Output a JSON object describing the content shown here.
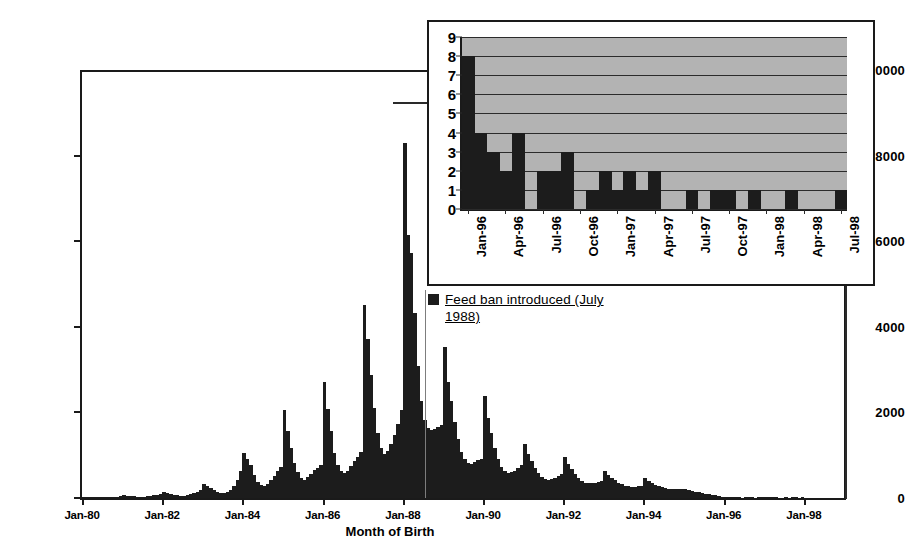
{
  "chart_data": [
    {
      "id": "main",
      "type": "bar",
      "title": "",
      "xlabel": "Month of Birth",
      "ylabel": "",
      "ylim": [
        0,
        10000
      ],
      "y_ticks": [
        0,
        2000,
        4000,
        6000,
        8000,
        10000
      ],
      "y_tick_labels": [
        "0",
        "2000",
        "4000",
        "6000",
        "8000",
        "10000"
      ],
      "x_tick_labels": [
        "Jan-80",
        "Jan-82",
        "Jan-84",
        "Jan-86",
        "Jan-88",
        "Jan-90",
        "Jan-92",
        "Jan-94",
        "Jan-96",
        "Jan-98"
      ],
      "x_start": "Jan-80",
      "x_end": "Dec-98",
      "grid": false,
      "bar_color": "#1c1c1c",
      "annotation": {
        "label": "Feed ban introduced (July 1988)",
        "x": "Jul-88",
        "line_color": "#7d7d7d"
      },
      "legend": {
        "position": "inside-right",
        "entries": [
          {
            "label": "Feed ban introduced (July 1988)",
            "color": "#1c1c1c"
          }
        ]
      },
      "categories": [
        "Jan-80",
        "Feb-80",
        "Mar-80",
        "Apr-80",
        "May-80",
        "Jun-80",
        "Jul-80",
        "Aug-80",
        "Sep-80",
        "Oct-80",
        "Nov-80",
        "Dec-80",
        "Jan-81",
        "Feb-81",
        "Mar-81",
        "Apr-81",
        "May-81",
        "Jun-81",
        "Jul-81",
        "Aug-81",
        "Sep-81",
        "Oct-81",
        "Nov-81",
        "Dec-81",
        "Jan-82",
        "Feb-82",
        "Mar-82",
        "Apr-82",
        "May-82",
        "Jun-82",
        "Jul-82",
        "Aug-82",
        "Sep-82",
        "Oct-82",
        "Nov-82",
        "Dec-82",
        "Jan-83",
        "Feb-83",
        "Mar-83",
        "Apr-83",
        "May-83",
        "Jun-83",
        "Jul-83",
        "Aug-83",
        "Sep-83",
        "Oct-83",
        "Nov-83",
        "Dec-83",
        "Jan-84",
        "Feb-84",
        "Mar-84",
        "Apr-84",
        "May-84",
        "Jun-84",
        "Jul-84",
        "Aug-84",
        "Sep-84",
        "Oct-84",
        "Nov-84",
        "Dec-84",
        "Jan-85",
        "Feb-85",
        "Mar-85",
        "Apr-85",
        "May-85",
        "Jun-85",
        "Jul-85",
        "Aug-85",
        "Sep-85",
        "Oct-85",
        "Nov-85",
        "Dec-85",
        "Jan-86",
        "Feb-86",
        "Mar-86",
        "Apr-86",
        "May-86",
        "Jun-86",
        "Jul-86",
        "Aug-86",
        "Sep-86",
        "Oct-86",
        "Nov-86",
        "Dec-86",
        "Jan-87",
        "Feb-87",
        "Mar-87",
        "Apr-87",
        "May-87",
        "Jun-87",
        "Jul-87",
        "Aug-87",
        "Sep-87",
        "Oct-87",
        "Nov-87",
        "Dec-87",
        "Jan-88",
        "Feb-88",
        "Mar-88",
        "Apr-88",
        "May-88",
        "Jun-88",
        "Jul-88",
        "Aug-88",
        "Sep-88",
        "Oct-88",
        "Nov-88",
        "Dec-88",
        "Jan-89",
        "Feb-89",
        "Mar-89",
        "Apr-89",
        "May-89",
        "Jun-89",
        "Jul-89",
        "Aug-89",
        "Sep-89",
        "Oct-89",
        "Nov-89",
        "Dec-89",
        "Jan-90",
        "Feb-90",
        "Mar-90",
        "Apr-90",
        "May-90",
        "Jun-90",
        "Jul-90",
        "Aug-90",
        "Sep-90",
        "Oct-90",
        "Nov-90",
        "Dec-90",
        "Jan-91",
        "Feb-91",
        "Mar-91",
        "Apr-91",
        "May-91",
        "Jun-91",
        "Jul-91",
        "Aug-91",
        "Sep-91",
        "Oct-91",
        "Nov-91",
        "Dec-91",
        "Jan-92",
        "Feb-92",
        "Mar-92",
        "Apr-92",
        "May-92",
        "Jun-92",
        "Jul-92",
        "Aug-92",
        "Sep-92",
        "Oct-92",
        "Nov-92",
        "Dec-92",
        "Jan-93",
        "Feb-93",
        "Mar-93",
        "Apr-93",
        "May-93",
        "Jun-93",
        "Jul-93",
        "Aug-93",
        "Sep-93",
        "Oct-93",
        "Nov-93",
        "Dec-93",
        "Jan-94",
        "Feb-94",
        "Mar-94",
        "Apr-94",
        "May-94",
        "Jun-94",
        "Jul-94",
        "Aug-94",
        "Sep-94",
        "Oct-94",
        "Nov-94",
        "Dec-94",
        "Jan-95",
        "Feb-95",
        "Mar-95",
        "Apr-95",
        "May-95",
        "Jun-95",
        "Jul-95",
        "Aug-95",
        "Sep-95",
        "Oct-95",
        "Nov-95",
        "Dec-95",
        "Jan-96",
        "Feb-96",
        "Mar-96",
        "Apr-96",
        "May-96",
        "Jun-96",
        "Jul-96",
        "Aug-96",
        "Sep-96",
        "Oct-96",
        "Nov-96",
        "Dec-96",
        "Jan-97",
        "Feb-97",
        "Mar-97",
        "Apr-97",
        "May-97",
        "Jun-97",
        "Jul-97",
        "Aug-97",
        "Sep-97",
        "Oct-97",
        "Nov-97",
        "Dec-97",
        "Jan-98",
        "Feb-98",
        "Mar-98",
        "Apr-98",
        "May-98",
        "Jun-98",
        "Jul-98",
        "Aug-98",
        "Sep-98",
        "Oct-98",
        "Nov-98",
        "Dec-98"
      ],
      "values": [
        30,
        25,
        20,
        20,
        15,
        15,
        15,
        20,
        25,
        30,
        35,
        40,
        60,
        50,
        45,
        40,
        30,
        30,
        30,
        40,
        50,
        60,
        70,
        90,
        150,
        120,
        100,
        80,
        60,
        55,
        55,
        70,
        90,
        120,
        150,
        190,
        330,
        280,
        230,
        180,
        130,
        110,
        110,
        140,
        190,
        280,
        420,
        620,
        1050,
        900,
        760,
        540,
        380,
        300,
        280,
        330,
        420,
        520,
        620,
        720,
        2060,
        1560,
        1160,
        820,
        600,
        470,
        430,
        480,
        560,
        660,
        700,
        760,
        2720,
        2080,
        1560,
        1060,
        780,
        620,
        580,
        640,
        740,
        860,
        960,
        1080,
        4500,
        3720,
        2880,
        2100,
        1520,
        1180,
        1020,
        1100,
        1260,
        1480,
        1740,
        2060,
        8300,
        6150,
        5720,
        4320,
        3080,
        2260,
        1820,
        1640,
        1580,
        1620,
        1660,
        1700,
        3520,
        2720,
        2260,
        1780,
        1380,
        1080,
        900,
        820,
        800,
        840,
        880,
        920,
        2380,
        1880,
        1520,
        1180,
        900,
        720,
        620,
        580,
        600,
        640,
        700,
        760,
        1260,
        1020,
        860,
        700,
        580,
        500,
        450,
        430,
        440,
        470,
        520,
        560,
        960,
        800,
        680,
        560,
        470,
        400,
        360,
        340,
        340,
        350,
        370,
        390,
        620,
        540,
        470,
        410,
        360,
        320,
        290,
        270,
        260,
        260,
        270,
        280,
        460,
        400,
        350,
        310,
        280,
        250,
        230,
        215,
        205,
        200,
        200,
        200,
        210,
        185,
        165,
        150,
        135,
        120,
        105,
        95,
        80,
        65,
        50,
        35,
        8,
        4,
        3,
        2,
        4,
        0,
        2,
        2,
        3,
        0,
        1,
        2,
        1,
        2,
        1,
        2,
        0,
        0,
        1,
        0,
        1,
        1,
        0,
        1,
        0,
        0,
        0,
        0,
        0,
        0,
        0,
        0,
        0,
        0,
        0,
        0
      ]
    },
    {
      "id": "inset",
      "type": "bar",
      "title": "",
      "xlabel": "",
      "ylabel": "",
      "ylim": [
        0,
        9
      ],
      "y_ticks": [
        0,
        1,
        2,
        3,
        4,
        5,
        6,
        7,
        8,
        9
      ],
      "y_tick_labels": [
        "0",
        "1",
        "2",
        "3",
        "4",
        "5",
        "6",
        "7",
        "8",
        "9"
      ],
      "grid": true,
      "plot_bg": "#b3b3b3",
      "bar_color": "#1c1c1c",
      "x_tick_labels": [
        "Jan-96",
        "Apr-96",
        "Jul-96",
        "Oct-96",
        "Jan-97",
        "Apr-97",
        "Jul-97",
        "Oct-97",
        "Jan-98",
        "Apr-98",
        "Jul-98"
      ],
      "categories": [
        "Jan-96",
        "Feb-96",
        "Mar-96",
        "Apr-96",
        "May-96",
        "Jun-96",
        "Jul-96",
        "Aug-96",
        "Sep-96",
        "Oct-96",
        "Nov-96",
        "Dec-96",
        "Jan-97",
        "Feb-97",
        "Mar-97",
        "Apr-97",
        "May-97",
        "Jun-97",
        "Jul-97",
        "Aug-97",
        "Sep-97",
        "Oct-97",
        "Nov-97",
        "Dec-97",
        "Jan-98",
        "Feb-98",
        "Mar-98",
        "Apr-98",
        "May-98",
        "Jun-98",
        "Jul-98"
      ],
      "values": [
        8,
        4,
        3,
        2,
        4,
        0,
        2,
        2,
        3,
        0,
        1,
        2,
        1,
        2,
        1,
        2,
        0,
        0,
        1,
        0,
        1,
        1,
        0,
        1,
        0,
        0,
        1,
        0,
        0,
        0,
        1
      ]
    }
  ]
}
